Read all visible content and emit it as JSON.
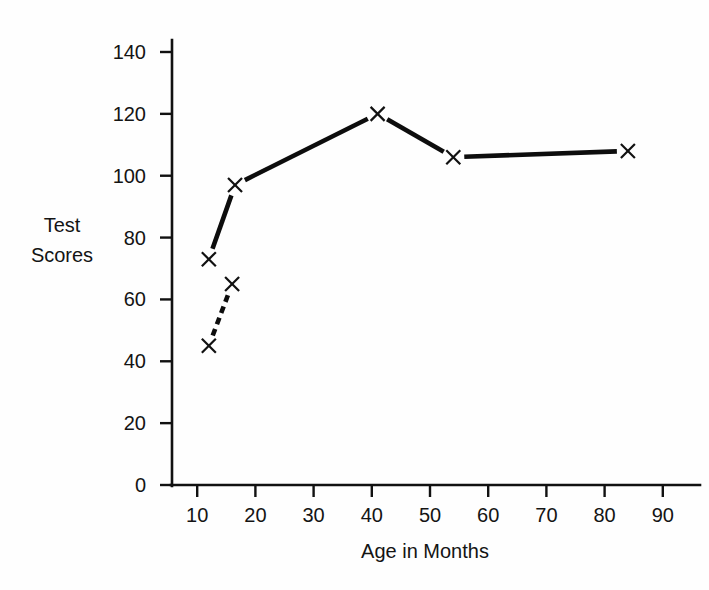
{
  "chart_data": {
    "type": "line",
    "title": "",
    "xlabel": "Age in Months",
    "ylabel": "Test Scores",
    "ylabel_lines": [
      "Test",
      "Scores"
    ],
    "xlim": [
      0,
      95
    ],
    "ylim": [
      0,
      145
    ],
    "grid": false,
    "legend": "none",
    "marker": "x",
    "x_ticks": [
      10,
      20,
      30,
      40,
      50,
      60,
      70,
      80,
      90
    ],
    "x_tick_labels": [
      "10",
      "20",
      "30",
      "40",
      "50",
      "60",
      "70",
      "80",
      "90"
    ],
    "y_ticks": [
      0,
      20,
      40,
      60,
      80,
      100,
      120,
      140
    ],
    "y_tick_labels": [
      "0",
      "20",
      "40",
      "60",
      "80",
      "100",
      "120",
      "140"
    ],
    "series": [
      {
        "name": "upper-series",
        "line_style": "solid",
        "color": "#0d0d0d",
        "points": [
          {
            "x": 12,
            "y": 73
          },
          {
            "x": 16.5,
            "y": 97
          },
          {
            "x": 41,
            "y": 120
          },
          {
            "x": 54,
            "y": 106
          },
          {
            "x": 84,
            "y": 108
          }
        ]
      },
      {
        "name": "lower-series",
        "line_style": "dashed",
        "color": "#0d0d0d",
        "points": [
          {
            "x": 12,
            "y": 45
          },
          {
            "x": 16,
            "y": 65
          }
        ]
      }
    ]
  },
  "figure": {
    "background": "#fefefe",
    "ink_color": "#111111"
  }
}
